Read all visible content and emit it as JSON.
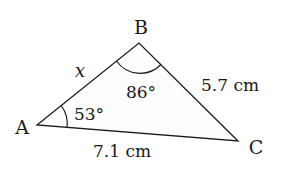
{
  "figure": {
    "type": "triangle",
    "vertices": {
      "A": {
        "label": "A",
        "x": 37,
        "y": 125
      },
      "B": {
        "label": "B",
        "x": 139,
        "y": 43
      },
      "C": {
        "label": "C",
        "x": 238,
        "y": 141
      }
    },
    "sides": {
      "AB": {
        "label": "x"
      },
      "BC": {
        "label": "5.7 cm"
      },
      "AC": {
        "label": "7.1 cm"
      }
    },
    "angles": {
      "A": {
        "label": "53°"
      },
      "B": {
        "label": "86°"
      }
    },
    "colors": {
      "stroke": "#1a1a1a",
      "fill": "#fdfdfd",
      "background": "#ffffff"
    }
  }
}
